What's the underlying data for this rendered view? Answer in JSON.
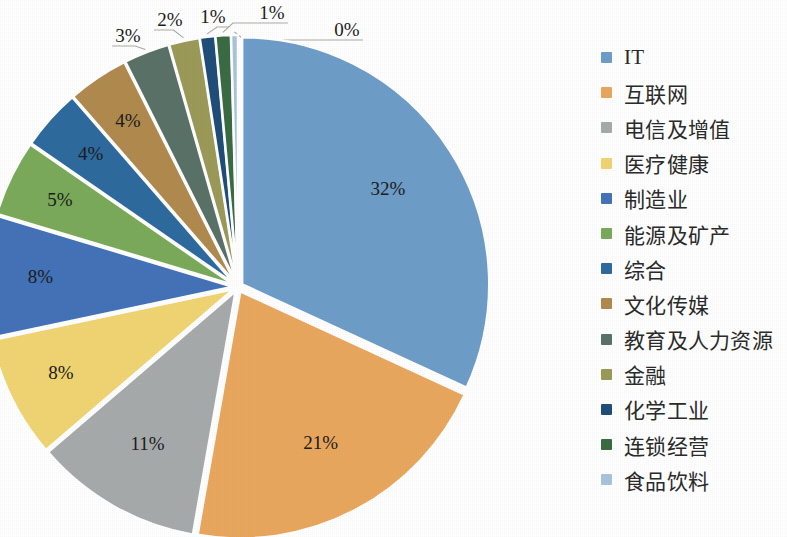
{
  "chart_data": {
    "type": "pie",
    "title": "",
    "legend_position": "right",
    "start_angle_deg": 0,
    "direction": "clockwise",
    "categories": [
      "IT",
      "互联网",
      "电信及增值",
      "医疗健康",
      "制造业",
      "能源及矿产",
      "综合",
      "文化传媒",
      "教育及人力资源",
      "金融",
      "化学工业",
      "连锁经营",
      "食品饮料"
    ],
    "values": [
      32,
      21,
      11,
      8,
      8,
      5,
      4,
      4,
      3,
      2,
      1,
      1,
      0
    ],
    "labels": [
      "32%",
      "21%",
      "11%",
      "8%",
      "8%",
      "5%",
      "4%",
      "4%",
      "3%",
      "2%",
      "1%",
      "1%",
      "0%"
    ],
    "colors": [
      "#6d9dc8",
      "#e9a75e",
      "#a7aaab",
      "#f0d472",
      "#4472b8",
      "#7aaa5a",
      "#2e6a9e",
      "#b08a4e",
      "#5a7168",
      "#9b9a58",
      "#1f4e79",
      "#3a6b42",
      "#a8c4dc"
    ],
    "slices": [
      {
        "label": "IT",
        "value": 32,
        "display": "32%",
        "color": "#6d9dc8",
        "label_placement": "inside"
      },
      {
        "label": "互联网",
        "value": 21,
        "display": "21%",
        "color": "#e9a75e",
        "label_placement": "inside"
      },
      {
        "label": "电信及增值",
        "value": 11,
        "display": "11%",
        "color": "#a7aaab",
        "label_placement": "inside"
      },
      {
        "label": "医疗健康",
        "value": 8,
        "display": "8%",
        "color": "#f0d472",
        "label_placement": "inside"
      },
      {
        "label": "制造业",
        "value": 8,
        "display": "8%",
        "color": "#4472b8",
        "label_placement": "inside"
      },
      {
        "label": "能源及矿产",
        "value": 5,
        "display": "5%",
        "color": "#7aaa5a",
        "label_placement": "inside"
      },
      {
        "label": "综合",
        "value": 4,
        "display": "4%",
        "color": "#2e6a9e",
        "label_placement": "inside"
      },
      {
        "label": "文化传媒",
        "value": 4,
        "display": "4%",
        "color": "#b08a4e",
        "label_placement": "inside"
      },
      {
        "label": "教育及人力资源",
        "value": 3,
        "display": "3%",
        "color": "#5a7168",
        "label_placement": "outside"
      },
      {
        "label": "金融",
        "value": 2,
        "display": "2%",
        "color": "#9b9a58",
        "label_placement": "outside"
      },
      {
        "label": "化学工业",
        "value": 1,
        "display": "1%",
        "color": "#1f4e79",
        "label_placement": "outside"
      },
      {
        "label": "连锁经营",
        "value": 1,
        "display": "1%",
        "color": "#3a6b42",
        "label_placement": "outside"
      },
      {
        "label": "食品饮料",
        "value": 0,
        "display": "0%",
        "color": "#a8c4dc",
        "label_placement": "outside"
      }
    ]
  },
  "legend": {
    "items": [
      {
        "label": "IT",
        "color": "#6d9dc8"
      },
      {
        "label": "互联网",
        "color": "#e9a75e"
      },
      {
        "label": "电信及增值",
        "color": "#a7aaab"
      },
      {
        "label": "医疗健康",
        "color": "#f0d472"
      },
      {
        "label": "制造业",
        "color": "#4472b8"
      },
      {
        "label": "能源及矿产",
        "color": "#7aaa5a"
      },
      {
        "label": "综合",
        "color": "#2e6a9e"
      },
      {
        "label": "文化传媒",
        "color": "#b08a4e"
      },
      {
        "label": "教育及人力资源",
        "color": "#5a7168"
      },
      {
        "label": "金融",
        "color": "#9b9a58"
      },
      {
        "label": "化学工业",
        "color": "#1f4e79"
      },
      {
        "label": "连锁经营",
        "color": "#3a6b42"
      },
      {
        "label": "食品饮料",
        "color": "#a8c4dc"
      }
    ]
  },
  "outer_labels": [
    {
      "display": "3%",
      "x": 128,
      "y": 38
    },
    {
      "display": "2%",
      "x": 170,
      "y": 22
    },
    {
      "display": "1%",
      "x": 213,
      "y": 19
    },
    {
      "display": "1%",
      "x": 272,
      "y": 15
    },
    {
      "display": "0%",
      "x": 347,
      "y": 32
    }
  ]
}
